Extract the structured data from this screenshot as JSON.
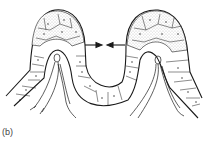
{
  "figure": {
    "panel_label": "(b)",
    "colors": {
      "line": "#1a1a1a",
      "stipple": "#9a9a9a",
      "background": "#ffffff"
    },
    "arrows": [
      {
        "direction": "right",
        "name": "left-arrow"
      },
      {
        "direction": "left",
        "name": "right-arrow"
      }
    ]
  }
}
